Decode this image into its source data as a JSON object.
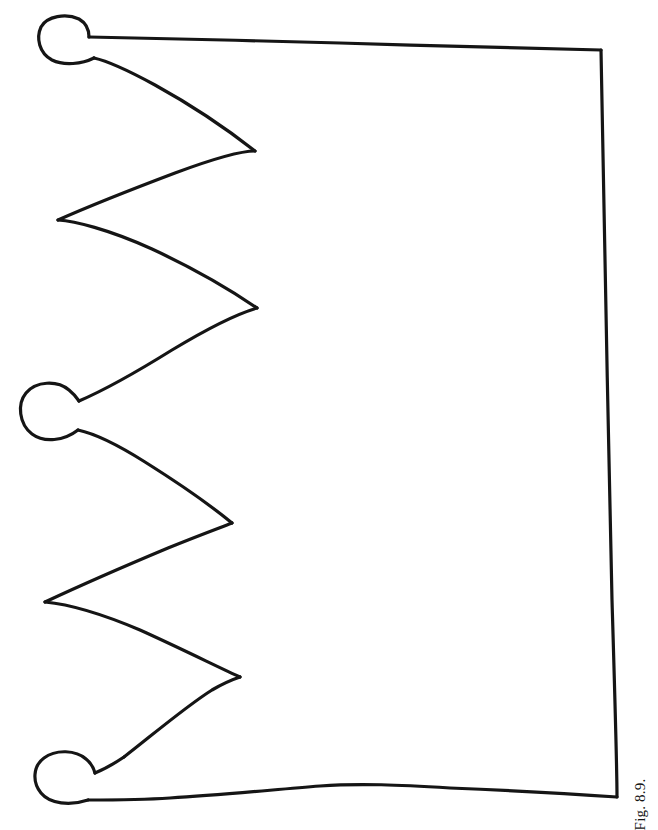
{
  "figure": {
    "caption": "Fig. 8.9.",
    "caption_orientation": "rotated-90-ccw",
    "alt_description": "Line drawing outline of a crown pattern with four zigzag points and three rounded knobs along the left edge",
    "ink_color": "#151515",
    "background_color": "#ffffff",
    "stroke_width": 3.2,
    "canvas": {
      "width": 658,
      "height": 823
    },
    "outline_path": "M 88 36 L 300 40 L 460 45 L 601 50 L 605 300 L 610 560 L 614 720 L 617 797 L 500 793 L 380 786 L 300 790 L 200 795 L 120 799 L 86 800 L 85 778 L 88 763 L 112 757 L 140 745 L 175 712 L 240 678 L 175 640 L 110 612 L 45 602 L 95 576 L 150 552 L 200 536 L 232 523 L 190 495 L 140 462 L 95 438 L 68 432 L 68 420 L 66 404 L 72 392 L 95 388 L 128 366 L 180 336 L 225 316 L 257 308 L 215 283 L 160 254 L 105 230 L 58 220 L 110 198 L 165 177 L 215 161 L 255 152 L 210 122 L 155 89 L 110 64 L 90 60 L 88 44 Z",
    "knobs": [
      {
        "name": "top-left-knob",
        "cx": 65,
        "cy": 40,
        "rx": 26,
        "ry": 23
      },
      {
        "name": "middle-left-knob",
        "cx": 44,
        "cy": 414,
        "rx": 25,
        "ry": 27
      },
      {
        "name": "bottom-left-knob",
        "cx": 61,
        "cy": 781,
        "rx": 24,
        "ry": 25
      }
    ],
    "points": [
      {
        "name": "point-1",
        "x": 255,
        "y": 152
      },
      {
        "name": "point-2",
        "x": 257,
        "y": 308
      },
      {
        "name": "point-3",
        "x": 232,
        "y": 523
      },
      {
        "name": "point-4",
        "x": 240,
        "y": 678
      }
    ],
    "valleys": [
      {
        "name": "valley-1",
        "x": 58,
        "y": 220
      },
      {
        "name": "valley-2",
        "x": 45,
        "y": 602
      }
    ],
    "corners": [
      {
        "name": "top-right-corner",
        "x": 601,
        "y": 50
      },
      {
        "name": "bottom-right-corner",
        "x": 617,
        "y": 797
      }
    ]
  }
}
